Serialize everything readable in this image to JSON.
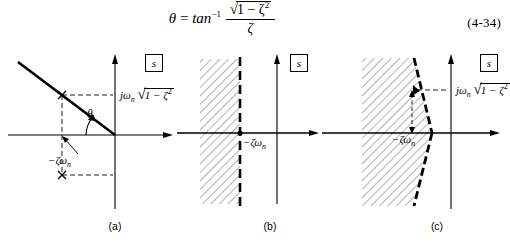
{
  "equation": {
    "lhs": "θ",
    "equals": "=",
    "fn": "tan",
    "fn_exponent": "−1",
    "numerator_radical_body": "1 − ζ",
    "numerator_radical_exponent": "2",
    "denominator": "ζ",
    "number": "(4-34)"
  },
  "panels": [
    {
      "id": "a",
      "caption": "(a)",
      "splane_label": "s",
      "labels": {
        "imag_coordinate": "jω",
        "imag_coordinate_sub": "n",
        "imag_radical_body": "1 − ζ",
        "imag_radical_exponent": "2",
        "real_coordinate": "−ζω",
        "real_coordinate_sub": "n",
        "angle": "θ"
      },
      "poles": [
        "upper-pole-x",
        "lower-pole-x"
      ]
    },
    {
      "id": "b",
      "caption": "(b)",
      "splane_label": "s",
      "labels": {
        "real_coordinate": "−ζω",
        "real_coordinate_sub": "n"
      },
      "region": "half-plane-left-of-boundary"
    },
    {
      "id": "c",
      "caption": "(c)",
      "splane_label": "s",
      "labels": {
        "imag_coordinate": "jω",
        "imag_coordinate_sub": "n",
        "imag_radical_body": "1 − ζ",
        "imag_radical_exponent": "2",
        "real_coordinate": "−ζω",
        "real_coordinate_sub": "n"
      },
      "region": "wedge-sector"
    }
  ],
  "colors": {
    "ink": "#000000",
    "background": "#ffffff",
    "hatch": "#7a7a7a"
  }
}
